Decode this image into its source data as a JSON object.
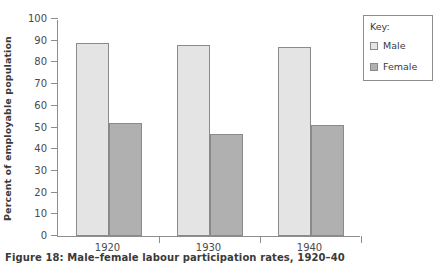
{
  "caption": "Figure 18: Male–female labour participation rates, 1920–40",
  "legend": {
    "title": "Key:",
    "entries": [
      {
        "label": "Male",
        "color": "#e4e4e4"
      },
      {
        "label": "Female",
        "color": "#b0b0b0"
      }
    ]
  },
  "chart_data": {
    "type": "bar",
    "title": "",
    "xlabel": "",
    "ylabel": "Percent of employable population",
    "categories": [
      "1920",
      "1930",
      "1940"
    ],
    "series": [
      {
        "name": "Male",
        "values": [
          89,
          88,
          87
        ],
        "color": "#e4e4e4"
      },
      {
        "name": "Female",
        "values": [
          52,
          47,
          51
        ],
        "color": "#b0b0b0"
      }
    ],
    "ylim": [
      0,
      100
    ],
    "ytick_step": 10,
    "yticks": [
      0,
      10,
      20,
      30,
      40,
      50,
      60,
      70,
      80,
      90,
      100
    ],
    "ytick_labels": [
      "0",
      "10",
      "20",
      "30",
      "40",
      "50",
      "60",
      "70",
      "80",
      "90",
      "100"
    ],
    "grid": false,
    "legend_position": "right-outside"
  }
}
